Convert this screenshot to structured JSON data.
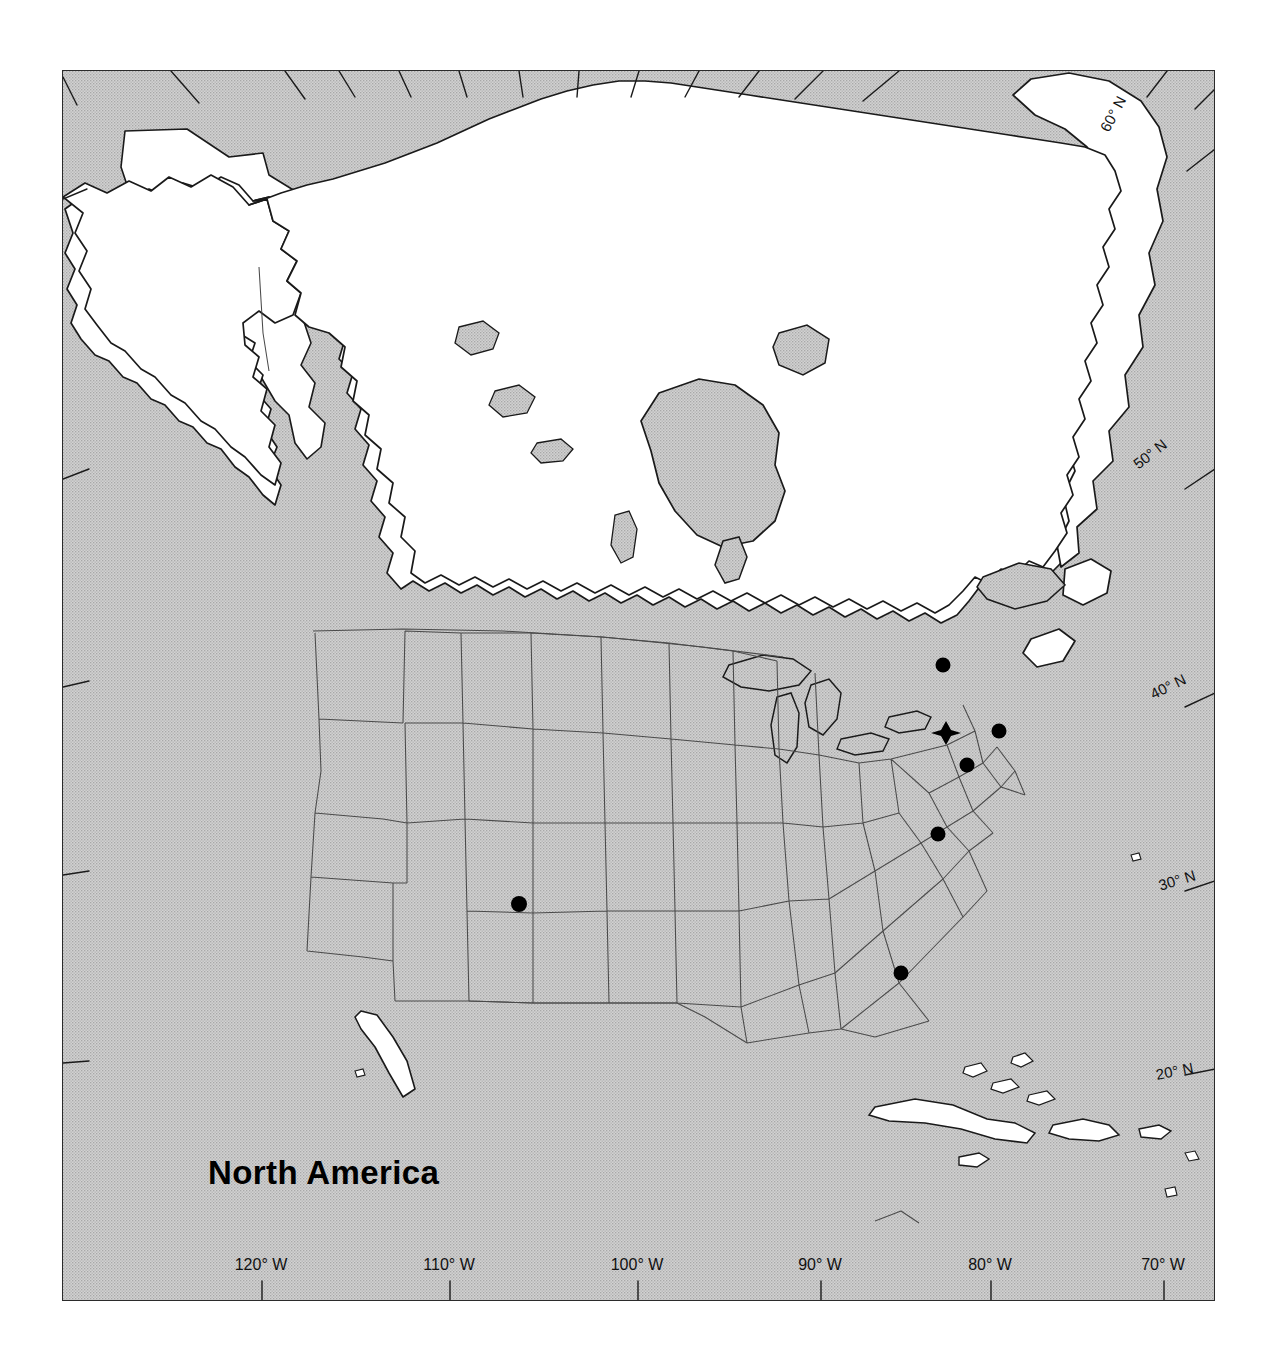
{
  "page": {
    "running_head": "",
    "page_number": ""
  },
  "map": {
    "title": "North America",
    "projection": "conic",
    "ocean_color": "#c9c9c9",
    "land_color": "#ffffff",
    "outline_color": "#1a1a1a",
    "border_color": "#2b2b2b",
    "marker_color": "#000000",
    "latitude_labels": [
      {
        "label": "60° N",
        "x": 1104,
        "y": 122,
        "angle": -62
      },
      {
        "label": "50° N",
        "x": 1135,
        "y": 457,
        "angle": -38
      },
      {
        "label": "40° N",
        "x": 1151,
        "y": 686,
        "angle": -26
      },
      {
        "label": "30° N",
        "x": 1159,
        "y": 877,
        "angle": -17
      },
      {
        "label": "20° N",
        "x": 1156,
        "y": 1066,
        "angle": -11
      }
    ],
    "longitude_labels": [
      {
        "label": "120°  W",
        "x": 261
      },
      {
        "label": "110°  W",
        "x": 449
      },
      {
        "label": "100°  W",
        "x": 637
      },
      {
        "label": "90°  W",
        "x": 820
      },
      {
        "label": "80°  W",
        "x": 990
      },
      {
        "label": "70°  W",
        "x": 1163
      }
    ],
    "markers": [
      {
        "type": "star",
        "name": "primary-site-marker",
        "x": 945,
        "y": 732
      },
      {
        "type": "dot",
        "name": "site-marker-montreal",
        "x": 942,
        "y": 664
      },
      {
        "type": "dot",
        "name": "site-marker-boston",
        "x": 998,
        "y": 730
      },
      {
        "type": "dot",
        "name": "site-marker-new-york",
        "x": 966,
        "y": 764
      },
      {
        "type": "dot",
        "name": "site-marker-virginia",
        "x": 937,
        "y": 833
      },
      {
        "type": "dot",
        "name": "site-marker-florida",
        "x": 900,
        "y": 972
      },
      {
        "type": "dot",
        "name": "site-marker-new-mexico",
        "x": 518,
        "y": 903
      }
    ]
  }
}
